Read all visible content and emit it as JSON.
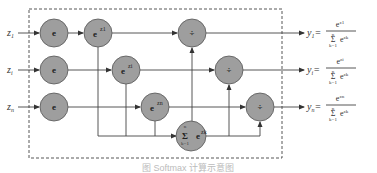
{
  "diagram": {
    "inputs": [
      {
        "label": "z",
        "subscript": "1"
      },
      {
        "label": "z",
        "subscript": "i"
      },
      {
        "label": "z",
        "subscript": "n"
      }
    ],
    "exp_nodes": [
      {
        "label": "e"
      },
      {
        "label": "e"
      },
      {
        "label": "e"
      }
    ],
    "power_nodes": [
      {
        "base": "e",
        "exponent": "z1"
      },
      {
        "base": "e",
        "exponent": "zi"
      },
      {
        "base": "e",
        "exponent": "zn"
      }
    ],
    "divide_nodes": [
      {
        "symbol": "÷"
      },
      {
        "symbol": "÷"
      },
      {
        "symbol": "÷"
      }
    ],
    "sum_node": {
      "symbol": "Σ",
      "upper": "n",
      "lower": "k=1",
      "term": "e",
      "term_sup": "zk",
      "label": "Σ e^zk"
    },
    "outputs": [
      {
        "label": "y",
        "subscript": "1",
        "equals": "=",
        "numerator": "e",
        "numerator_sup": "z1",
        "sum_upper": "n",
        "sum_lower": "k=1",
        "denominator_term": "e",
        "denominator_sup": "zk"
      },
      {
        "label": "y",
        "subscript": "i",
        "equals": "=",
        "numerator": "e",
        "numerator_sup": "zi",
        "sum_upper": "n",
        "sum_lower": "k=1",
        "denominator_term": "e",
        "denominator_sup": "zk"
      },
      {
        "label": "y",
        "subscript": "n",
        "equals": "=",
        "numerator": "e",
        "numerator_sup": "zn",
        "sum_upper": "n",
        "sum_lower": "k=1",
        "denominator_term": "e",
        "denominator_sup": "zk"
      }
    ],
    "caption": "图 Softmax 计算示意图",
    "colors": {
      "node_fill": "#9e9e9e",
      "node_stroke": "#555555",
      "line": "#444444"
    }
  }
}
